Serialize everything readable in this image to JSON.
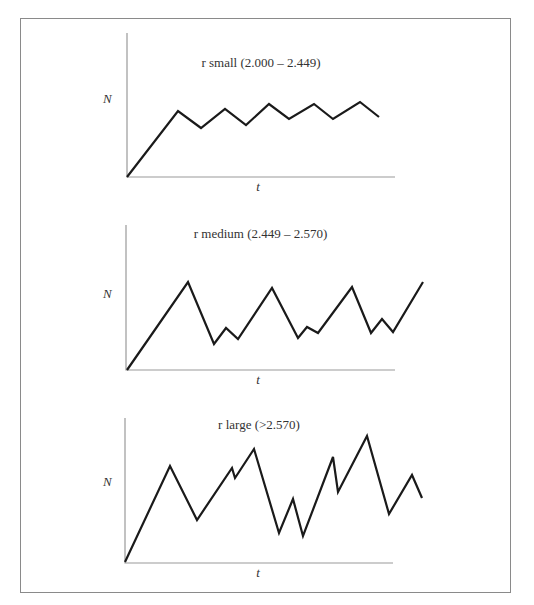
{
  "chart_data": [
    {
      "type": "line",
      "title": "r small (2.000 – 2.449)",
      "xlabel": "t",
      "ylabel": "N",
      "grid": false,
      "description": "Population rises then oscillates with regular two-point cycle",
      "pixel_points": [
        [
          127,
          177
        ],
        [
          178,
          111
        ],
        [
          201,
          128
        ],
        [
          225,
          109
        ],
        [
          246,
          125
        ],
        [
          269,
          104
        ],
        [
          289,
          119
        ],
        [
          314,
          104
        ],
        [
          333,
          119
        ],
        [
          360,
          102
        ],
        [
          379,
          117
        ]
      ],
      "axes": {
        "origin": [
          127,
          177
        ],
        "x_end": 395,
        "y_top": 33
      }
    },
    {
      "type": "line",
      "title": "r medium (2.449 – 2.570)",
      "xlabel": "t",
      "ylabel": "N",
      "grid": false,
      "description": "Population oscillates in a four-point cycle",
      "pixel_points": [
        [
          127,
          370
        ],
        [
          188,
          282
        ],
        [
          214,
          344
        ],
        [
          226,
          328
        ],
        [
          238,
          339
        ],
        [
          272,
          288
        ],
        [
          298,
          338
        ],
        [
          307,
          327
        ],
        [
          318,
          333
        ],
        [
          352,
          287
        ],
        [
          371,
          333
        ],
        [
          382,
          319
        ],
        [
          393,
          332
        ],
        [
          423,
          282
        ]
      ],
      "axes": {
        "origin": [
          126,
          370
        ],
        "x_end": 395,
        "y_top": 225
      }
    },
    {
      "type": "line",
      "title": "r large (>2.570)",
      "xlabel": "t",
      "ylabel": "N",
      "grid": false,
      "description": "Population fluctuates chaotically",
      "pixel_points": [
        [
          125,
          562
        ],
        [
          170,
          466
        ],
        [
          197,
          520
        ],
        [
          232,
          468
        ],
        [
          235,
          478
        ],
        [
          254,
          449
        ],
        [
          279,
          533
        ],
        [
          293,
          499
        ],
        [
          303,
          536
        ],
        [
          333,
          457
        ],
        [
          338,
          492
        ],
        [
          367,
          436
        ],
        [
          389,
          514
        ],
        [
          412,
          475
        ],
        [
          422,
          498
        ]
      ],
      "axes": {
        "origin": [
          125,
          563
        ],
        "x_end": 393,
        "y_top": 418
      }
    }
  ],
  "panels": [
    {
      "title": "r small (2.000 – 2.449)",
      "xlabel": "t",
      "ylabel": "N"
    },
    {
      "title": "r medium (2.449 – 2.570)",
      "xlabel": "t",
      "ylabel": "N"
    },
    {
      "title": "r large (>2.570)",
      "xlabel": "t",
      "ylabel": "N"
    }
  ]
}
